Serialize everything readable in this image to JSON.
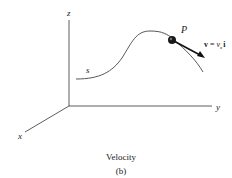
{
  "diagram": {
    "axes": {
      "x_label": "x",
      "y_label": "y",
      "z_label": "z"
    },
    "path_label": "s",
    "point_label": "P",
    "velocity": {
      "v": "v",
      "eq": " = ",
      "vx": "v",
      "sub": "x",
      "unit": "i"
    },
    "caption": "Velocity",
    "sub_caption": "(b)"
  },
  "colors": {
    "line": "#333333",
    "curve": "#444444",
    "arrow": "#111111"
  }
}
